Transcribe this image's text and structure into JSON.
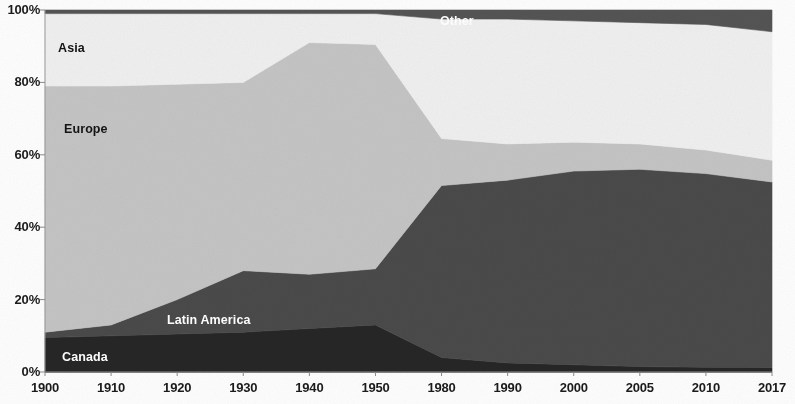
{
  "chart_data": {
    "type": "area",
    "stacked": true,
    "normalized_percent": true,
    "title": "",
    "subtitle": "",
    "xlabel": "",
    "ylabel": "",
    "categories": [
      "1900",
      "1910",
      "1920",
      "1930",
      "1940",
      "1950",
      "1980",
      "1990",
      "2000",
      "2005",
      "2010",
      "2017"
    ],
    "x_tick_labels": [
      "1900",
      "1910",
      "1920",
      "1930",
      "1940",
      "1950",
      "1980",
      "1990",
      "2000",
      "2005",
      "2010",
      "2017"
    ],
    "y_tick_labels": [
      "0%",
      "20%",
      "40%",
      "60%",
      "80%",
      "100%"
    ],
    "y_tick_values": [
      0,
      20,
      40,
      60,
      80,
      100
    ],
    "ylim": [
      0,
      100
    ],
    "grid": false,
    "legend": "inline-area-labels",
    "stack_order_bottom_to_top": [
      "Canada",
      "Latin America",
      "Europe",
      "Asia",
      "Other"
    ],
    "series": [
      {
        "name": "Canada",
        "color": "#262626",
        "label_color": "#ffffff",
        "values": [
          9.5,
          10.0,
          10.5,
          11.0,
          12.0,
          13.0,
          4.0,
          2.5,
          2.0,
          1.5,
          1.3,
          1.2
        ]
      },
      {
        "name": "Latin America",
        "color": "#4a4a4a",
        "label_color": "#ffffff",
        "values": [
          1.5,
          3.0,
          9.5,
          17.0,
          15.0,
          15.5,
          47.5,
          50.5,
          53.5,
          54.5,
          53.5,
          51.3
        ]
      },
      {
        "name": "Europe",
        "color": "#c4c4c4",
        "label_color": "#141414",
        "values": [
          68.0,
          66.0,
          59.5,
          52.0,
          64.0,
          62.0,
          13.0,
          10.0,
          8.0,
          7.0,
          6.5,
          6.0
        ]
      },
      {
        "name": "Asia",
        "color": "#efefef",
        "label_color": "#141414",
        "values": [
          20.0,
          20.0,
          19.5,
          19.0,
          8.0,
          8.5,
          33.0,
          34.5,
          33.5,
          33.5,
          34.7,
          35.5
        ]
      },
      {
        "name": "Other",
        "color": "#545454",
        "label_color": "#ffffff",
        "values": [
          1.0,
          1.0,
          1.0,
          1.0,
          1.0,
          1.0,
          2.5,
          2.5,
          3.0,
          3.5,
          4.0,
          6.0
        ]
      }
    ],
    "area_labels": [
      {
        "text": "Other",
        "series": "Other",
        "x_px": 440,
        "y_px": 14,
        "style": "light"
      },
      {
        "text": "Asia",
        "series": "Asia",
        "x_px": 58,
        "y_px": 41,
        "style": "dark"
      },
      {
        "text": "Europe",
        "series": "Europe",
        "x_px": 64,
        "y_px": 122,
        "style": "dark"
      },
      {
        "text": "Latin America",
        "series": "Latin America",
        "x_px": 167,
        "y_px": 313,
        "style": "light"
      },
      {
        "text": "Canada",
        "series": "Canada",
        "x_px": 62,
        "y_px": 350,
        "style": "light"
      }
    ],
    "plot_area_px": {
      "left": 45,
      "right": 772,
      "top": 10,
      "bottom": 372
    },
    "colors": {
      "canada": "#262626",
      "latin_america": "#4a4a4a",
      "europe": "#c4c4c4",
      "asia": "#efefef",
      "other": "#545454",
      "axis_text": "#1b1b1b",
      "background": "#fdfdfd"
    }
  }
}
